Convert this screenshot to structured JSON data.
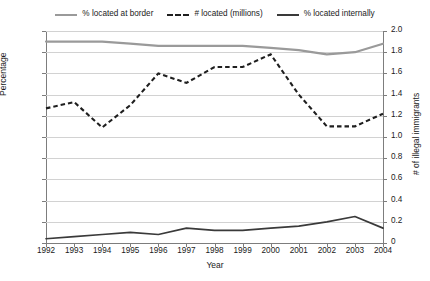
{
  "chart_data": {
    "type": "line",
    "title": "",
    "xlabel": "Year",
    "ylabel": "Percentage",
    "y2label": "# of illegal immigrants",
    "categories": [
      1992,
      1993,
      1994,
      1995,
      1996,
      1997,
      1998,
      1999,
      2000,
      2001,
      2002,
      2003,
      2004
    ],
    "x_tick_labels": [
      "1992",
      "1993",
      "1994",
      "1995",
      "1996",
      "1997",
      "1998",
      "1999",
      "2000",
      "2001",
      "2002",
      "2003",
      "2004"
    ],
    "ylim": [
      0,
      100
    ],
    "y_ticks": [
      0,
      10,
      20,
      30,
      40,
      50,
      60,
      70,
      80,
      90,
      100
    ],
    "y_tick_labels": [
      "0",
      "10",
      "20",
      "30",
      "40",
      "50",
      "60",
      "70",
      "80",
      "90",
      "100"
    ],
    "y2lim": [
      0,
      2.0
    ],
    "y2_ticks": [
      0,
      0.2,
      0.4,
      0.6,
      0.8,
      1.0,
      1.2,
      1.4,
      1.6,
      1.8,
      2.0
    ],
    "y2_tick_labels": [
      "0",
      "0.2",
      "0.4",
      "0.6",
      "0.8",
      "1.0",
      "1.2",
      "1.4",
      "1.6",
      "1.8",
      "2.0"
    ],
    "grid": true,
    "legend_position": "top",
    "series": [
      {
        "name": "% located at border",
        "axis": "left",
        "style": "solid",
        "color": "#9a9a9a",
        "values": [
          95,
          95,
          95,
          94,
          93,
          93,
          93,
          93,
          92,
          91,
          89,
          90,
          94
        ]
      },
      {
        "name": "# located (millions)",
        "axis": "right",
        "style": "dashed",
        "color": "#1f1f1f",
        "values": [
          1.27,
          1.33,
          1.09,
          1.3,
          1.6,
          1.51,
          1.66,
          1.66,
          1.78,
          1.4,
          1.1,
          1.1,
          1.22
        ]
      },
      {
        "name": "% located internally",
        "axis": "left",
        "style": "solid",
        "color": "#3a3a3a",
        "values": [
          2,
          3,
          4,
          5,
          4,
          7,
          6,
          6,
          7,
          8,
          10,
          12.5,
          7
        ]
      }
    ]
  },
  "legend": {
    "items": [
      {
        "label": "% located at border",
        "swatch": "solid-light-line-icon"
      },
      {
        "label": "# located (millions)",
        "swatch": "dashed-line-icon"
      },
      {
        "label": "% located internally",
        "swatch": "solid-dark-line-icon"
      }
    ]
  },
  "axes": {
    "left_title": "Percentage",
    "right_title": "# of illegal immigrants",
    "bottom_title": "Year"
  }
}
